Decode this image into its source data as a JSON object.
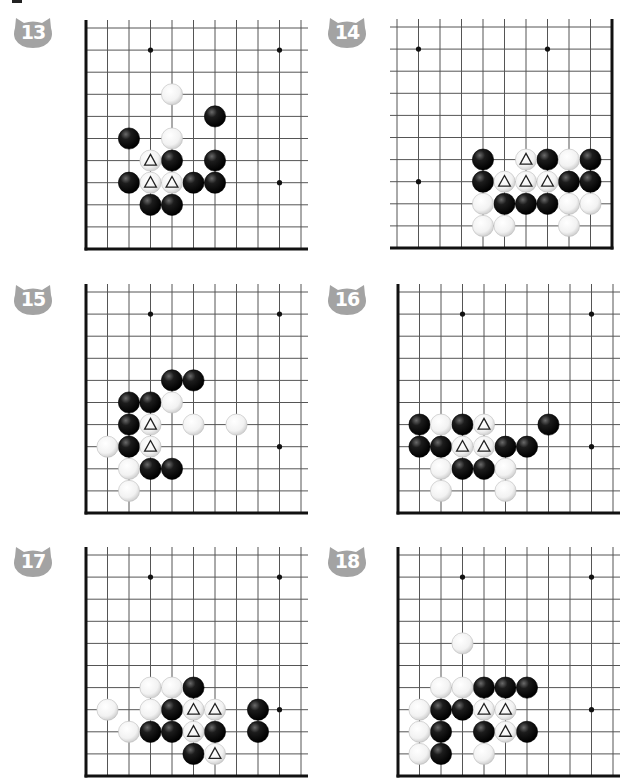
{
  "page": {
    "background": "#ffffff",
    "badge_color": "#a3a3a3",
    "line_color": "#555555",
    "edge_color": "#111111"
  },
  "geometry": {
    "sx": 21.5,
    "sy": 22.1,
    "lines": 11,
    "stone_r": 10.6
  },
  "problems": [
    {
      "number": "13",
      "badge": {
        "x": 13,
        "y": 16
      },
      "origin": {
        "x": 86,
        "y": 28
      },
      "edges": [
        "left",
        "bottom"
      ],
      "star_points": [
        [
          3,
          1
        ],
        [
          9,
          1
        ],
        [
          9,
          7
        ]
      ],
      "black": [
        [
          6,
          4
        ],
        [
          2,
          5
        ],
        [
          4,
          6
        ],
        [
          6,
          6
        ],
        [
          2,
          7
        ],
        [
          5,
          7
        ],
        [
          6,
          7
        ],
        [
          3,
          8
        ],
        [
          4,
          8
        ]
      ],
      "white": [
        [
          4,
          3
        ],
        [
          4,
          5
        ]
      ],
      "white_marked": [
        [
          3,
          6
        ],
        [
          3,
          7
        ],
        [
          4,
          7
        ]
      ],
      "black_marked": []
    },
    {
      "number": "14",
      "badge": {
        "x": 327,
        "y": 16
      },
      "origin": {
        "x": 397,
        "y": 27
      },
      "edges": [
        "right",
        "bottom"
      ],
      "star_points": [
        [
          1,
          1
        ],
        [
          7,
          1
        ],
        [
          1,
          7
        ]
      ],
      "black": [
        [
          4,
          6
        ],
        [
          7,
          6
        ],
        [
          9,
          6
        ],
        [
          4,
          7
        ],
        [
          8,
          7
        ],
        [
          9,
          7
        ],
        [
          5,
          8
        ],
        [
          6,
          8
        ],
        [
          7,
          8
        ]
      ],
      "white": [
        [
          8,
          6
        ],
        [
          4,
          8
        ],
        [
          8,
          8
        ],
        [
          9,
          8
        ],
        [
          4,
          9
        ],
        [
          5,
          9
        ],
        [
          8,
          9
        ]
      ],
      "white_marked": [
        [
          6,
          6
        ],
        [
          5,
          7
        ],
        [
          6,
          7
        ],
        [
          7,
          7
        ]
      ],
      "black_marked": []
    },
    {
      "number": "15",
      "badge": {
        "x": 13,
        "y": 283
      },
      "origin": {
        "x": 86,
        "y": 292
      },
      "edges": [
        "left",
        "bottom"
      ],
      "star_points": [
        [
          3,
          1
        ],
        [
          9,
          1
        ],
        [
          9,
          7
        ]
      ],
      "black": [
        [
          4,
          4
        ],
        [
          5,
          4
        ],
        [
          2,
          5
        ],
        [
          3,
          5
        ],
        [
          2,
          6
        ],
        [
          2,
          7
        ],
        [
          3,
          8
        ],
        [
          4,
          8
        ]
      ],
      "white": [
        [
          4,
          5
        ],
        [
          5,
          6
        ],
        [
          7,
          6
        ],
        [
          1,
          7
        ],
        [
          2,
          8
        ],
        [
          2,
          9
        ]
      ],
      "white_marked": [
        [
          3,
          6
        ],
        [
          3,
          7
        ]
      ],
      "black_marked": []
    },
    {
      "number": "16",
      "badge": {
        "x": 327,
        "y": 283
      },
      "origin": {
        "x": 398,
        "y": 292
      },
      "edges": [
        "left",
        "bottom"
      ],
      "star_points": [
        [
          3,
          1
        ],
        [
          9,
          1
        ],
        [
          9,
          7
        ]
      ],
      "black": [
        [
          1,
          6
        ],
        [
          3,
          6
        ],
        [
          7,
          6
        ],
        [
          1,
          7
        ],
        [
          2,
          7
        ],
        [
          5,
          7
        ],
        [
          6,
          7
        ],
        [
          3,
          8
        ],
        [
          4,
          8
        ]
      ],
      "white": [
        [
          2,
          6
        ],
        [
          2,
          8
        ],
        [
          5,
          8
        ],
        [
          2,
          9
        ],
        [
          5,
          9
        ]
      ],
      "white_marked": [
        [
          4,
          6
        ],
        [
          3,
          7
        ],
        [
          4,
          7
        ]
      ],
      "black_marked": []
    },
    {
      "number": "17",
      "badge": {
        "x": 13,
        "y": 545
      },
      "origin": {
        "x": 86,
        "y": 555
      },
      "edges": [
        "left",
        "bottom"
      ],
      "star_points": [
        [
          3,
          1
        ],
        [
          9,
          1
        ],
        [
          9,
          7
        ]
      ],
      "black": [
        [
          5,
          6
        ],
        [
          4,
          7
        ],
        [
          8,
          7
        ],
        [
          3,
          8
        ],
        [
          4,
          8
        ],
        [
          6,
          8
        ],
        [
          8,
          8
        ],
        [
          5,
          9
        ]
      ],
      "white": [
        [
          3,
          6
        ],
        [
          4,
          6
        ],
        [
          1,
          7
        ],
        [
          3,
          7
        ],
        [
          2,
          8
        ]
      ],
      "white_marked": [
        [
          5,
          7
        ],
        [
          6,
          7
        ],
        [
          5,
          8
        ],
        [
          6,
          9
        ]
      ],
      "black_marked": []
    },
    {
      "number": "18",
      "badge": {
        "x": 327,
        "y": 545
      },
      "origin": {
        "x": 398,
        "y": 555
      },
      "edges": [
        "left",
        "bottom"
      ],
      "star_points": [
        [
          3,
          1
        ],
        [
          9,
          1
        ],
        [
          9,
          7
        ]
      ],
      "black": [
        [
          4,
          6
        ],
        [
          5,
          6
        ],
        [
          6,
          6
        ],
        [
          2,
          7
        ],
        [
          3,
          7
        ],
        [
          2,
          8
        ],
        [
          4,
          8
        ],
        [
          6,
          8
        ],
        [
          2,
          9
        ]
      ],
      "white": [
        [
          3,
          4
        ],
        [
          2,
          6
        ],
        [
          3,
          6
        ],
        [
          1,
          7
        ],
        [
          1,
          8
        ],
        [
          1,
          9
        ],
        [
          4,
          9
        ]
      ],
      "white_marked": [
        [
          4,
          7
        ],
        [
          5,
          7
        ],
        [
          5,
          8
        ]
      ],
      "black_marked": []
    }
  ]
}
